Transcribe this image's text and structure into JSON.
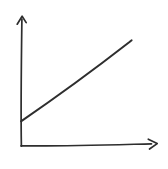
{
  "colors": {
    "ink": "#2e2e2e",
    "background": "#ffffff"
  },
  "icons": {
    "y_axis_arrowhead": "up-arrow",
    "x_axis_arrowhead": "right-arrow"
  },
  "chart_data": {
    "type": "line",
    "style": "hand-drawn-sketch",
    "title": "",
    "xlabel": "",
    "ylabel": "",
    "tick_labels": [],
    "legend": "none",
    "grid": false,
    "axes": {
      "x_arrow": true,
      "y_arrow": true,
      "x_range_normalized": [
        0,
        1
      ],
      "y_range_normalized": [
        0,
        1
      ]
    },
    "series": [
      {
        "name": "sketched-straight-line",
        "shape": "straight line, positive slope, positive y-intercept",
        "points_normalized": [
          {
            "x": 0.0,
            "y": 0.19
          },
          {
            "x": 0.81,
            "y": 0.8
          }
        ]
      }
    ]
  }
}
